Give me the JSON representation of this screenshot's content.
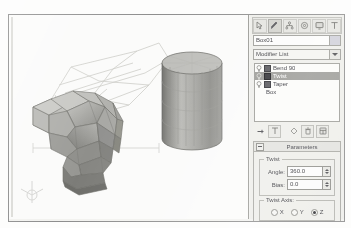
{
  "app": {
    "title": "3ds Max Modifier Panel",
    "object_name": "Box01",
    "modifier_list_label": "Modifier List"
  },
  "command_panel_tabs": [
    {
      "name": "create-tab",
      "icon": "arrow-cursor-icon",
      "selected": false
    },
    {
      "name": "modify-tab",
      "icon": "pencil-icon",
      "selected": true
    },
    {
      "name": "hierarchy-tab",
      "icon": "hierarchy-icon",
      "selected": false
    },
    {
      "name": "motion-tab",
      "icon": "wheel-icon",
      "selected": false
    },
    {
      "name": "display-tab",
      "icon": "monitor-icon",
      "selected": false
    },
    {
      "name": "utilities-tab",
      "icon": "hammer-icon",
      "selected": false
    }
  ],
  "modifier_stack": {
    "items": [
      {
        "label": "Bend 90",
        "selected": false,
        "is_base": false
      },
      {
        "label": "Twist",
        "selected": true,
        "is_base": false
      },
      {
        "label": "Taper",
        "selected": false,
        "is_base": false
      },
      {
        "label": "Box",
        "selected": false,
        "is_base": true
      }
    ]
  },
  "stack_tools": [
    {
      "name": "pin-stack-button",
      "icon": "pin-icon"
    },
    {
      "name": "show-end-result-button",
      "icon": "show-end-result-icon"
    },
    {
      "name": "make-unique-button",
      "icon": "make-unique-icon"
    },
    {
      "name": "remove-modifier-button",
      "icon": "trash-icon"
    },
    {
      "name": "configure-modifier-sets-button",
      "icon": "configure-icon"
    }
  ],
  "parameters_rollout": {
    "title": "Parameters",
    "twist_group": {
      "label": "Twist",
      "fields": [
        {
          "label": "Angle:",
          "value": "360.0"
        },
        {
          "label": "Bias:",
          "value": "0.0"
        }
      ]
    },
    "twist_axis_group": {
      "label": "Twist Axis:",
      "options": [
        {
          "label": "X",
          "selected": false
        },
        {
          "label": "Y",
          "selected": false
        },
        {
          "label": "Z",
          "selected": true
        }
      ]
    }
  },
  "limits_rollout": {
    "title": "Limits"
  },
  "viewport": {
    "objects": [
      {
        "name": "twisted-bent-box-mesh"
      },
      {
        "name": "cylinder-mesh"
      },
      {
        "name": "modifier-gizmo-wireframe"
      }
    ],
    "axis_tripod": "axis-tripod-icon"
  },
  "colors": {
    "panel_bg": "#eeeeea",
    "viewport_bg": "#fbfbfa",
    "selection": "#9a9a96",
    "field_bg": "#fcfcfb",
    "border": "#9d9d98",
    "mesh_fill": "#a8a8a4"
  }
}
